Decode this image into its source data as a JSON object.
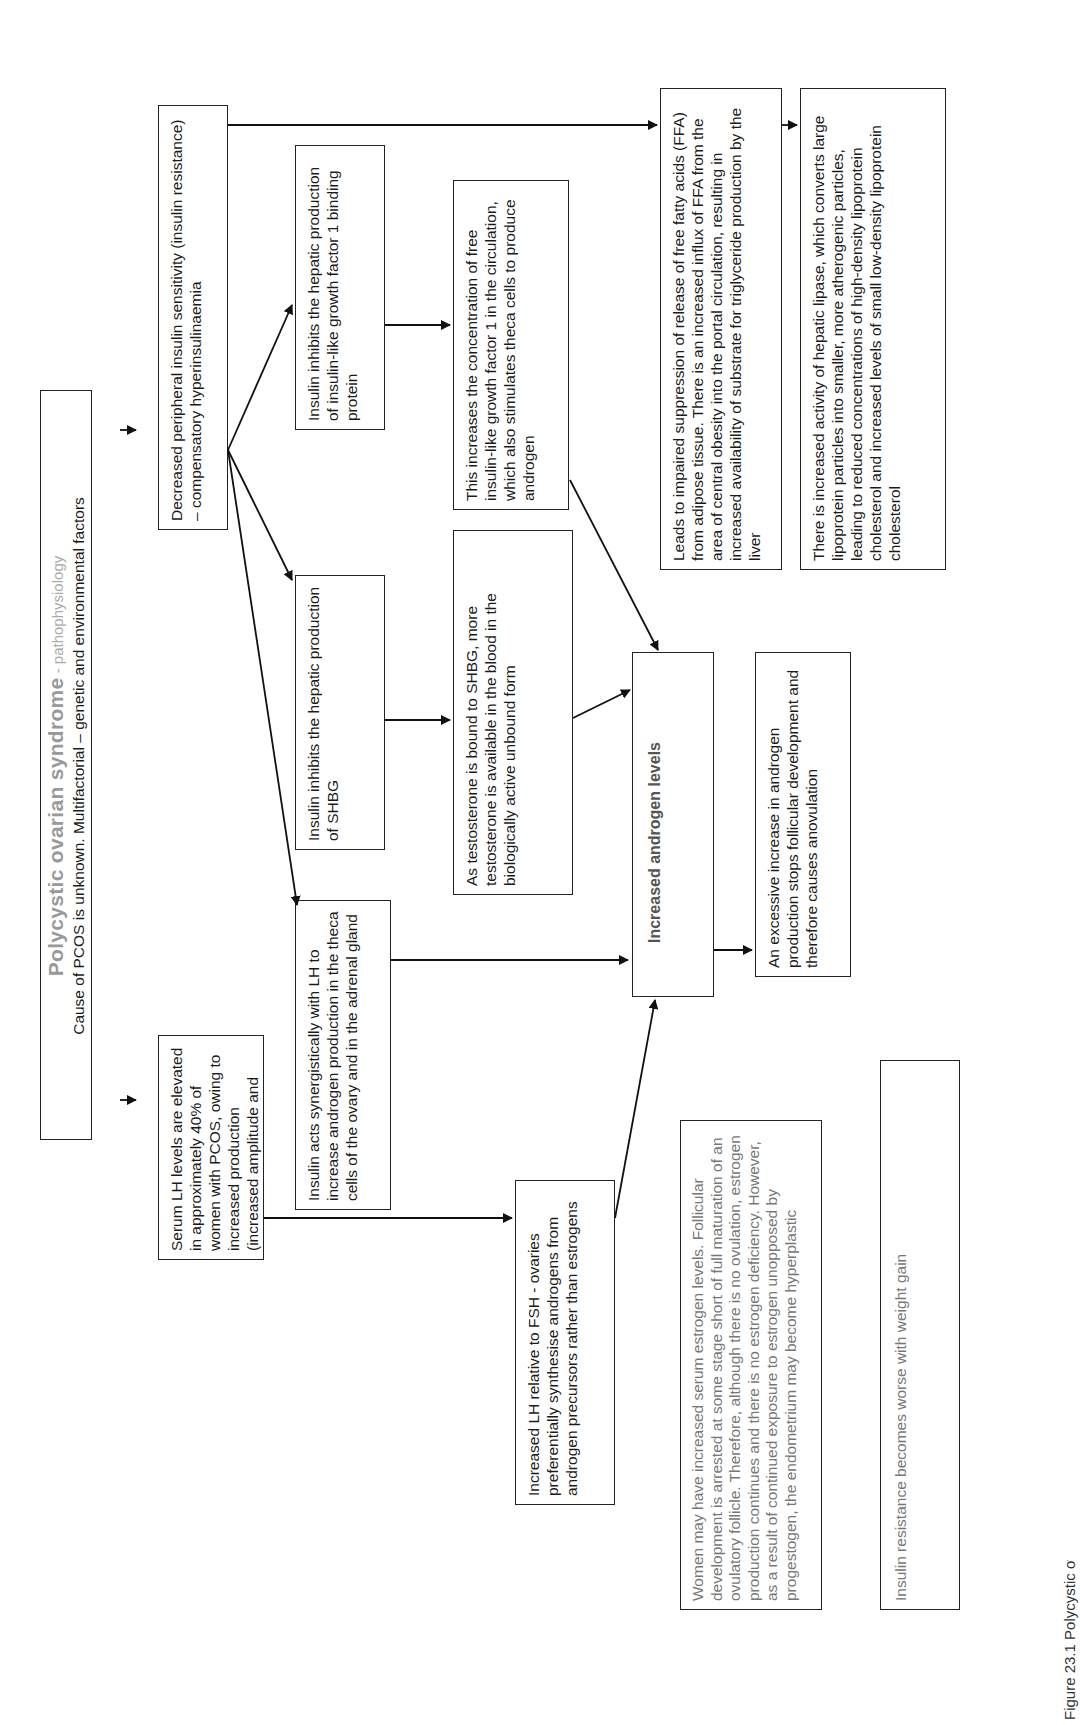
{
  "orientation": "rotated-90-ccw",
  "title": {
    "main": "Polycystic ovarian syndrome",
    "suffix": " - pathophysiology",
    "subtitle": "Cause of PCOS is unknown. Multifactorial – genetic and environmental factors"
  },
  "nodes": {
    "serum_lh": "Serum LH levels are elevated in approximately 40% of women with PCOS, owing to increased production (increased amplitude and frequency of LH pulses)",
    "insulin_resistance": "Decreased peripheral insulin sensitivity (insulin resistance) – compensatory hyperinsulinaemia",
    "insulin_igf": "Insulin inhibits the hepatic production of insulin-like growth factor 1 binding protein",
    "insulin_shbg": "Insulin inhibits the hepatic production of SHBG",
    "insulin_synergy": "Insulin acts synergistically with LH to increase androgen production in the theca cells of the ovary and in the adrenal gland",
    "igf_increase": "This increases the concentration of free insulin-like growth factor 1 in the circulation, which also stimulates theca cells to produce androgen",
    "testosterone_shbg": "As testosterone is bound to SHBG, more testosterone is available in the blood in the biologically active unbound form",
    "lh_fsh": "Increased LH relative to FSH - ovaries preferentially synthesise androgens from androgen precursors rather than estrogens",
    "ffa": "Leads to impaired suppression of release of free fatty acids (FFA) from adipose tissue. There is an increased influx of FFA from the area of central obesity into the portal circulation, resulting in increased availability of substrate for triglyceride production by the liver",
    "hepatic_lipase": "There is increased activity of hepatic lipase, which converts large lipoprotein particles into smaller, more atherogenic particles, leading to reduced concentrations of high-density lipoprotein cholesterol and increased levels of small low-density lipoprotein cholesterol",
    "androgen_levels": "Increased androgen levels",
    "anovulation": "An excessive increase in androgen production stops follicular development and therefore causes anovulation",
    "estrogen": "Women may have increased serum estrogen levels. Follicular development is arrested at some stage short of full maturation of an ovulatory follicle. Therefore, although there is no ovulation, estrogen production continues and there is no estrogen deficiency. However, as a result of continued exposure to estrogen unopposed by progestogen, the endometrium may become hyperplastic",
    "weight_gain": "Insulin resistance becomes worse with weight gain"
  },
  "caption_fragment": "Figure 23.1  Polycystic ovarian syndrome",
  "colors": {
    "line": "#222222",
    "grey_text": "#777777",
    "title_grey": "#999999"
  }
}
